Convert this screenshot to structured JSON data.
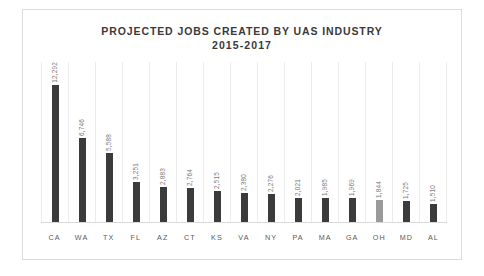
{
  "chart_data": {
    "type": "bar",
    "title": "PROJECTED JOBS CREATED BY UAS INDUSTRY",
    "subtitle": "2015-2017",
    "xlabel": "",
    "ylabel": "",
    "ylim": [
      0,
      13000
    ],
    "grid": "vertical-category-separators",
    "legend": "none",
    "categories": [
      "CA",
      "WA",
      "TX",
      "FL",
      "AZ",
      "CT",
      "KS",
      "VA",
      "NY",
      "PA",
      "MA",
      "GA",
      "OH",
      "MD",
      "AL"
    ],
    "values": [
      12292,
      6746,
      5588,
      3251,
      2883,
      2764,
      2515,
      2380,
      2276,
      2021,
      1985,
      1969,
      1844,
      1725,
      1510
    ],
    "value_labels": [
      "12,292",
      "6,746",
      "5,588",
      "3,251",
      "2,883",
      "2,764",
      "2,515",
      "2,380",
      "2,276",
      "2,021",
      "1,985",
      "1,969",
      "1,844",
      "1,725",
      "1,510"
    ],
    "highlighted_category": "OH",
    "colors": {
      "bar": "#3b3b3b",
      "bar_highlight": "#9a9a9a",
      "title": "#3a3a3a",
      "value_label": "#7d7d7d",
      "axis_label": "#5a5a5a",
      "gridline": "#ececec",
      "frame": "#dcdcdc"
    },
    "bars": [
      {
        "category": "CA",
        "value": 12292,
        "label": "12,292",
        "highlight": false
      },
      {
        "category": "WA",
        "value": 6746,
        "label": "6,746",
        "highlight": false
      },
      {
        "category": "TX",
        "value": 5588,
        "label": "5,588",
        "highlight": false
      },
      {
        "category": "FL",
        "value": 3251,
        "label": "3,251",
        "highlight": false
      },
      {
        "category": "AZ",
        "value": 2883,
        "label": "2,883",
        "highlight": false
      },
      {
        "category": "CT",
        "value": 2764,
        "label": "2,764",
        "highlight": false
      },
      {
        "category": "KS",
        "value": 2515,
        "label": "2,515",
        "highlight": false
      },
      {
        "category": "VA",
        "value": 2380,
        "label": "2,380",
        "highlight": false
      },
      {
        "category": "NY",
        "value": 2276,
        "label": "2,276",
        "highlight": false
      },
      {
        "category": "PA",
        "value": 2021,
        "label": "2,021",
        "highlight": false
      },
      {
        "category": "MA",
        "value": 1985,
        "label": "1,985",
        "highlight": false
      },
      {
        "category": "GA",
        "value": 1969,
        "label": "1,969",
        "highlight": false
      },
      {
        "category": "OH",
        "value": 1844,
        "label": "1,844",
        "highlight": true
      },
      {
        "category": "MD",
        "value": 1725,
        "label": "1,725",
        "highlight": false
      },
      {
        "category": "AL",
        "value": 1510,
        "label": "1,510",
        "highlight": false
      }
    ]
  }
}
